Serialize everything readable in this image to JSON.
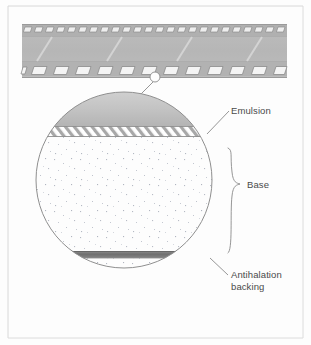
{
  "figure": {
    "kind": "cross-section-diagram",
    "background_color": "#fdfdfd",
    "frame_color": "#c9c9c9",
    "line_color": "#8a8a8a"
  },
  "film_strip": {
    "name": "film-strip",
    "body_color": "#b9b9b9",
    "edge_color": "#a6a6a6",
    "frame_line_color": "#d6d6d6",
    "sprocket_fill": "#f2f2f2",
    "sprocket_stroke": "#8d8d8d",
    "top_sprocket_count": 24,
    "bottom_sprocket_count": 12,
    "frame_divider_count": 3
  },
  "callout": {
    "name": "magnifier-callout",
    "marker_label": "detail-marker",
    "leader_label": "leader-line"
  },
  "magnified_view": {
    "name": "magnified-cross-section",
    "circle": {
      "cx": 124,
      "cy": 180,
      "r": 88
    },
    "layers": [
      {
        "id": "emulsion",
        "label": "Emulsion",
        "pattern": "diagonal-hatch",
        "fill": "#ffffff",
        "hatch_color": "#9c9c9c",
        "top": 126,
        "bottom": 137
      },
      {
        "id": "base",
        "label": "Base",
        "pattern": "speckle",
        "fill": "#fcfcfc",
        "speckle_color": "#b9bcc4",
        "top": 137,
        "bottom": 251
      },
      {
        "id": "antihalation",
        "label": "Antihalation backing",
        "pattern": "solid",
        "fill": "#7d7d7d",
        "top": 251,
        "bottom": 258
      }
    ],
    "top_cap": {
      "id": "emulsion-cap",
      "fill": "#c4c4c4",
      "description": "shaded dome above the emulsion band"
    }
  },
  "annotations": {
    "emulsion": {
      "name": "label-emulsion",
      "text": "Emulsion",
      "x": 231,
      "y": 114
    },
    "base": {
      "name": "label-base",
      "text": "Base",
      "x": 247,
      "y": 203,
      "brace": {
        "top": 148,
        "bottom": 253,
        "x": 232
      }
    },
    "antihalation": {
      "name": "label-antihalation",
      "line1": "Antihalation",
      "line2": "backing",
      "x": 231,
      "y1": 278,
      "y2": 290
    }
  }
}
